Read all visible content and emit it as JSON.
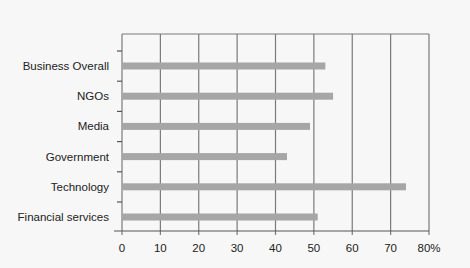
{
  "chart_data": {
    "type": "bar",
    "orientation": "horizontal",
    "title": "",
    "xlabel": "",
    "ylabel": "",
    "categories": [
      "Business Overall",
      "NGOs",
      "Media",
      "Government",
      "Technology",
      "Financial services"
    ],
    "values": [
      53,
      55,
      49,
      43,
      74,
      51
    ],
    "xlim": [
      0,
      80
    ],
    "xticks": [
      "0",
      "10",
      "20",
      "30",
      "40",
      "50",
      "60",
      "70",
      "80%"
    ],
    "grid": true,
    "legend": null,
    "colors": {
      "bar": "#a6a6a6",
      "grid": "#7a7a7a",
      "axis": "#555555",
      "background": "#f7f7f7"
    }
  }
}
